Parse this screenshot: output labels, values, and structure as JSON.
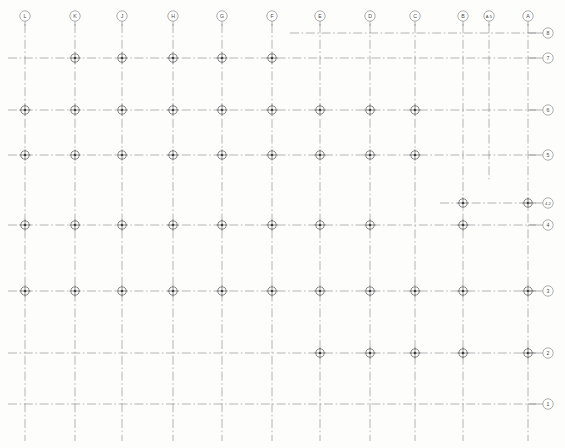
{
  "drawing": {
    "title": "Structural Column Grid Plan",
    "type": "column-grid-framing-plan",
    "width": 565,
    "height": 448,
    "background_color": "#fdfdfc",
    "line_color": "#8a8a8a",
    "bubble_stroke_color": "#6b6b6b",
    "column_marker_color": "#3d3d3d",
    "line_style": "dash-dot center line"
  },
  "column_gridlines": [
    {
      "label": "L",
      "x": 25,
      "top": 24,
      "bottom": 441
    },
    {
      "label": "K",
      "x": 75,
      "top": 24,
      "bottom": 441
    },
    {
      "label": "J",
      "x": 122,
      "top": 24,
      "bottom": 441
    },
    {
      "label": "H",
      "x": 173,
      "top": 24,
      "bottom": 441
    },
    {
      "label": "G",
      "x": 222,
      "top": 24,
      "bottom": 441
    },
    {
      "label": "F",
      "x": 272,
      "top": 24,
      "bottom": 441
    },
    {
      "label": "E",
      "x": 320,
      "top": 24,
      "bottom": 441
    },
    {
      "label": "D",
      "x": 370,
      "top": 24,
      "bottom": 441
    },
    {
      "label": "C",
      "x": 415,
      "top": 24,
      "bottom": 441
    },
    {
      "label": "B",
      "x": 463,
      "top": 24,
      "bottom": 441
    },
    {
      "label": "A.5",
      "x": 489,
      "top": 24,
      "bottom": 181
    },
    {
      "label": "A",
      "x": 528,
      "top": 24,
      "bottom": 441
    }
  ],
  "row_gridlines": [
    {
      "label": "8",
      "y": 33,
      "left": 290,
      "right": 536
    },
    {
      "label": "7",
      "y": 58,
      "left": 8,
      "right": 536
    },
    {
      "label": "6",
      "y": 110,
      "left": 8,
      "right": 536
    },
    {
      "label": "5",
      "y": 155,
      "left": 8,
      "right": 536
    },
    {
      "label": "4.2",
      "y": 203,
      "left": 440,
      "right": 536
    },
    {
      "label": "4",
      "y": 225,
      "left": 8,
      "right": 536
    },
    {
      "label": "3",
      "y": 291,
      "left": 8,
      "right": 536
    },
    {
      "label": "2",
      "y": 353,
      "left": 8,
      "right": 536
    },
    {
      "label": "1",
      "y": 404,
      "left": 8,
      "right": 536
    }
  ],
  "column_bubbles": [
    {
      "label": "L",
      "cx": 25,
      "cy": 16
    },
    {
      "label": "K",
      "cx": 75,
      "cy": 16
    },
    {
      "label": "J",
      "cx": 122,
      "cy": 16
    },
    {
      "label": "H",
      "cx": 173,
      "cy": 16
    },
    {
      "label": "G",
      "cx": 222,
      "cy": 16
    },
    {
      "label": "F",
      "cx": 272,
      "cy": 16
    },
    {
      "label": "E",
      "cx": 320,
      "cy": 16
    },
    {
      "label": "D",
      "cx": 370,
      "cy": 16
    },
    {
      "label": "C",
      "cx": 415,
      "cy": 16
    },
    {
      "label": "B",
      "cx": 463,
      "cy": 16
    },
    {
      "label": "A.5",
      "cx": 489,
      "cy": 16
    },
    {
      "label": "A",
      "cx": 528,
      "cy": 16
    }
  ],
  "row_bubbles": [
    {
      "label": "8",
      "cx": 548,
      "cy": 33
    },
    {
      "label": "7",
      "cx": 548,
      "cy": 58
    },
    {
      "label": "6",
      "cx": 548,
      "cy": 110
    },
    {
      "label": "5",
      "cx": 548,
      "cy": 155
    },
    {
      "label": "4.2",
      "cx": 548,
      "cy": 203
    },
    {
      "label": "4",
      "cx": 548,
      "cy": 225
    },
    {
      "label": "3",
      "cx": 548,
      "cy": 291
    },
    {
      "label": "2",
      "cx": 548,
      "cy": 353
    },
    {
      "label": "1",
      "cx": 548,
      "cy": 404
    }
  ],
  "columns": [
    {
      "grid": "K-7",
      "x": 75,
      "y": 58
    },
    {
      "grid": "J-7",
      "x": 122,
      "y": 58
    },
    {
      "grid": "H-7",
      "x": 173,
      "y": 58
    },
    {
      "grid": "G-7",
      "x": 222,
      "y": 58
    },
    {
      "grid": "F-7",
      "x": 272,
      "y": 58
    },
    {
      "grid": "L-6",
      "x": 25,
      "y": 110
    },
    {
      "grid": "K-6",
      "x": 75,
      "y": 110
    },
    {
      "grid": "J-6",
      "x": 122,
      "y": 110
    },
    {
      "grid": "H-6",
      "x": 173,
      "y": 110
    },
    {
      "grid": "G-6",
      "x": 222,
      "y": 110
    },
    {
      "grid": "F-6",
      "x": 272,
      "y": 110
    },
    {
      "grid": "E-6",
      "x": 320,
      "y": 110
    },
    {
      "grid": "D-6",
      "x": 370,
      "y": 110
    },
    {
      "grid": "C-6",
      "x": 415,
      "y": 110
    },
    {
      "grid": "L-5",
      "x": 25,
      "y": 155
    },
    {
      "grid": "K-5",
      "x": 75,
      "y": 155
    },
    {
      "grid": "J-5",
      "x": 122,
      "y": 155
    },
    {
      "grid": "H-5",
      "x": 173,
      "y": 155
    },
    {
      "grid": "G-5",
      "x": 222,
      "y": 155
    },
    {
      "grid": "F-5",
      "x": 272,
      "y": 155
    },
    {
      "grid": "E-5",
      "x": 320,
      "y": 155
    },
    {
      "grid": "D-5",
      "x": 370,
      "y": 155
    },
    {
      "grid": "C-5",
      "x": 415,
      "y": 155
    },
    {
      "grid": "B-4.2",
      "x": 463,
      "y": 203
    },
    {
      "grid": "A-4.2",
      "x": 528,
      "y": 203
    },
    {
      "grid": "L-4",
      "x": 25,
      "y": 225
    },
    {
      "grid": "K-4",
      "x": 75,
      "y": 225
    },
    {
      "grid": "J-4",
      "x": 122,
      "y": 225
    },
    {
      "grid": "H-4",
      "x": 173,
      "y": 225
    },
    {
      "grid": "G-4",
      "x": 222,
      "y": 225
    },
    {
      "grid": "F-4",
      "x": 272,
      "y": 225
    },
    {
      "grid": "E-4",
      "x": 320,
      "y": 225
    },
    {
      "grid": "D-4",
      "x": 370,
      "y": 225
    },
    {
      "grid": "B-4",
      "x": 463,
      "y": 225
    },
    {
      "grid": "L-3",
      "x": 25,
      "y": 291
    },
    {
      "grid": "K-3",
      "x": 75,
      "y": 291
    },
    {
      "grid": "J-3",
      "x": 122,
      "y": 291
    },
    {
      "grid": "H-3",
      "x": 173,
      "y": 291
    },
    {
      "grid": "G-3",
      "x": 222,
      "y": 291
    },
    {
      "grid": "F-3",
      "x": 272,
      "y": 291
    },
    {
      "grid": "E-3",
      "x": 320,
      "y": 291
    },
    {
      "grid": "D-3",
      "x": 370,
      "y": 291
    },
    {
      "grid": "C-3",
      "x": 415,
      "y": 291
    },
    {
      "grid": "B-3",
      "x": 463,
      "y": 291
    },
    {
      "grid": "A-3",
      "x": 528,
      "y": 291
    },
    {
      "grid": "E-2",
      "x": 320,
      "y": 353
    },
    {
      "grid": "D-2",
      "x": 370,
      "y": 353
    },
    {
      "grid": "C-2",
      "x": 415,
      "y": 353
    },
    {
      "grid": "B-2",
      "x": 463,
      "y": 353
    },
    {
      "grid": "A-2",
      "x": 528,
      "y": 353
    }
  ]
}
